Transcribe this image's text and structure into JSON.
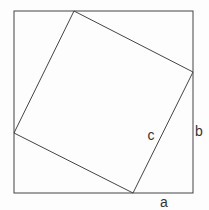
{
  "diagram": {
    "canvas": {
      "width": 209,
      "height": 210
    },
    "background_color": "#fdfdfd",
    "stroke_color": "#444444",
    "stroke_width": 1,
    "text_color": "#333333",
    "font_size": 14,
    "outer_square": {
      "x1": 14,
      "y1": 11,
      "x2": 193,
      "y2": 193
    },
    "inner_square": {
      "points": [
        [
          74,
          11
        ],
        [
          193,
          72
        ],
        [
          133,
          193
        ],
        [
          14,
          133
        ]
      ]
    },
    "labels": [
      {
        "text": "a",
        "x": 164,
        "y": 207
      },
      {
        "text": "b",
        "x": 199,
        "y": 136
      },
      {
        "text": "c",
        "x": 151,
        "y": 140
      }
    ]
  }
}
